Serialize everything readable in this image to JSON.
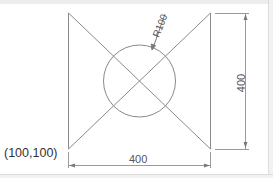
{
  "drawing": {
    "origin_label": "(100,100)",
    "width_dimension": "400",
    "height_dimension": "400",
    "radius_label": "R100"
  },
  "colors": {
    "line": "#8a8a8a",
    "dimension": "#7a7a7a",
    "text": "#333333",
    "background": "#ffffff"
  }
}
